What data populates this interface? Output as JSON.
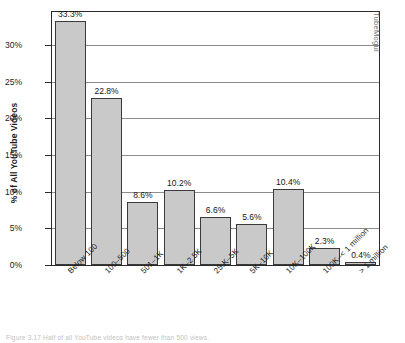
{
  "chart_data": {
    "type": "bar",
    "title": "",
    "subtitle": "",
    "xlabel": "",
    "ylabel": "% of All YouTube Videos",
    "categories": [
      "Below 100",
      "100–500",
      "501–1K",
      "1K–2.5K",
      "25.K–5K",
      "5K–10K",
      "10K–100K",
      "100K–< 1 million",
      "> 1 million"
    ],
    "values": [
      33.3,
      22.8,
      8.6,
      10.2,
      6.6,
      5.6,
      10.4,
      2.3,
      0.4
    ],
    "value_labels": [
      "33.3%",
      "22.8%",
      "8.6%",
      "10.2%",
      "6.6%",
      "5.6%",
      "10.4%",
      "2.3%",
      "0.4%"
    ],
    "ylim": [
      0,
      34.5
    ],
    "yticks": [
      0,
      5,
      10,
      15,
      20,
      25,
      30
    ],
    "ytick_labels": [
      "0%",
      "5%",
      "10%",
      "15%",
      "20%",
      "25%",
      "30%"
    ],
    "grid": true,
    "legend": "none",
    "bar_color": "#c9c9c9",
    "bar_border_color": "#3a3a3a",
    "grid_color": "#8d8d8d",
    "axis_color": "#2b2b2b"
  },
  "annotations": {
    "watermark": "TubeMogul",
    "caption": "Figure 3.17  Half of all YouTube videos have fewer than 500 views."
  }
}
